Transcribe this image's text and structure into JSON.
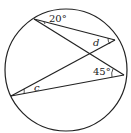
{
  "diagram": {
    "type": "circle-geometry",
    "circle": {
      "cx": 66,
      "cy": 70,
      "r": 61
    },
    "points": {
      "A": {
        "x": 34,
        "y": 19
      },
      "B": {
        "x": 115,
        "y": 40
      },
      "C": {
        "x": 124,
        "y": 75
      },
      "D": {
        "x": 11,
        "y": 96
      }
    },
    "chords": [
      {
        "from": "A",
        "to": "B"
      },
      {
        "from": "A",
        "to": "C"
      },
      {
        "from": "D",
        "to": "B"
      },
      {
        "from": "D",
        "to": "C"
      }
    ],
    "labels": {
      "angle_top": "20°",
      "angle_d": "d",
      "angle_right": "45°",
      "angle_c": "c"
    },
    "colors": {
      "stroke": "#222222",
      "background": "#ffffff"
    }
  }
}
